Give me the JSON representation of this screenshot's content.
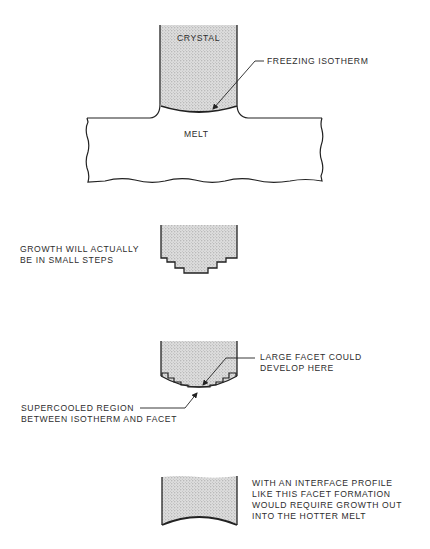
{
  "figure": {
    "panels": [
      {
        "id": "panel-1",
        "description": "Crystal pulled from melt with curved freezing isotherm",
        "labels": {
          "crystal": "CRYSTAL",
          "melt": "MELT",
          "callout": "FREEZING ISOTHERM"
        }
      },
      {
        "id": "panel-2",
        "description": "Stepped growth interface",
        "labels": {
          "callout_lines": [
            "GROWTH WILL ACTUALLY",
            "BE IN SMALL STEPS"
          ]
        }
      },
      {
        "id": "panel-3",
        "description": "Facet and supercooled region",
        "labels": {
          "facet_callout_lines": [
            "LARGE FACET COULD",
            "DEVELOP HERE"
          ],
          "supercooled_callout_lines": [
            "SUPERCOOLED REGION",
            "BETWEEN ISOTHERM AND FACET"
          ]
        }
      },
      {
        "id": "panel-4",
        "description": "Concave interface profile",
        "labels": {
          "callout_lines": [
            "WITH AN INTERFACE PROFILE",
            "LIKE THIS FACET FORMATION",
            "WOULD REQUIRE GROWTH OUT",
            "INTO THE HOTTER MELT"
          ]
        }
      }
    ],
    "colors": {
      "line": "#222222",
      "stipple_fill": "#d9d9d9",
      "stipple_dot": "#8a8a8a",
      "background": "#ffffff"
    }
  }
}
